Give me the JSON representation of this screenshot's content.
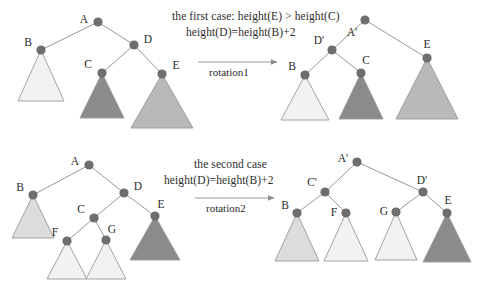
{
  "figure": {
    "title_top": "the first case:  height(E) > height(C)",
    "title_top_line2": "height(D)=height(B)+2",
    "title_bottom": "the second case",
    "title_bottom_line2": "height(D)=height(B)+2",
    "arrow_top_label": "rotation1",
    "arrow_bottom_label": "rotation2",
    "colors": {
      "node_fill": "#6e6e6e",
      "node_stroke": "#5a5a5a",
      "edge": "#8d8d8d",
      "triangle_stroke": "#9a9a9a",
      "tri_lightest": "#f2f2f2",
      "tri_light": "#e8e8e8",
      "tri_mid": "#dcdcdc",
      "tri_medium": "#b9b9b9",
      "tri_dark": "#8b8b8b",
      "text": "#2c2c2c"
    }
  },
  "diagrams": [
    {
      "id": "case1-before",
      "name": "first-case-before-rotation",
      "nodes": [
        {
          "label": "A",
          "x": 98,
          "y": 22,
          "label_x": 84,
          "label_y": 19
        },
        {
          "label": "B",
          "x": 41,
          "y": 50,
          "label_x": 28,
          "label_y": 42
        },
        {
          "label": "D",
          "x": 134,
          "y": 45,
          "label_x": 148,
          "label_y": 39
        },
        {
          "label": "C",
          "x": 102,
          "y": 73,
          "label_x": 88,
          "label_y": 64
        },
        {
          "label": "E",
          "x": 162,
          "y": 74,
          "label_x": 176,
          "label_y": 65
        }
      ],
      "edges": [
        {
          "from": "A",
          "to": "B"
        },
        {
          "from": "A",
          "to": "D"
        },
        {
          "from": "D",
          "to": "C"
        },
        {
          "from": "D",
          "to": "E"
        }
      ],
      "triangles": [
        {
          "label": "B",
          "apex_x": 41,
          "apex_y": 50,
          "half_width": 23,
          "height": 51,
          "fill": "#f2f2f2"
        },
        {
          "label": "C",
          "apex_x": 102,
          "apex_y": 73,
          "half_width": 22,
          "height": 45,
          "fill": "#8b8b8b"
        },
        {
          "label": "E",
          "apex_x": 162,
          "apex_y": 74,
          "half_width": 31,
          "height": 54,
          "fill": "#b9b9b9"
        }
      ]
    },
    {
      "id": "case1-after",
      "name": "first-case-after-rotation",
      "nodes": [
        {
          "label": "A'",
          "x": 365,
          "y": 20,
          "label_x": 352,
          "label_y": 32
        },
        {
          "label": "D'",
          "x": 332,
          "y": 50,
          "label_x": 319,
          "label_y": 40
        },
        {
          "label": "E",
          "x": 427,
          "y": 58,
          "label_x": 427,
          "label_y": 44
        },
        {
          "label": "B",
          "x": 305,
          "y": 75,
          "label_x": 292,
          "label_y": 66
        },
        {
          "label": "C",
          "x": 361,
          "y": 73,
          "label_x": 366,
          "label_y": 60
        }
      ],
      "edges": [
        {
          "from": "A'",
          "to": "D'"
        },
        {
          "from": "A'",
          "to": "E"
        },
        {
          "from": "D'",
          "to": "B"
        },
        {
          "from": "D'",
          "to": "C"
        }
      ],
      "triangles": [
        {
          "label": "B",
          "apex_x": 305,
          "apex_y": 75,
          "half_width": 24,
          "height": 45,
          "fill": "#f2f2f2"
        },
        {
          "label": "C",
          "apex_x": 361,
          "apex_y": 73,
          "half_width": 22,
          "height": 46,
          "fill": "#8b8b8b"
        },
        {
          "label": "E",
          "apex_x": 427,
          "apex_y": 58,
          "half_width": 31,
          "height": 61,
          "fill": "#b9b9b9"
        }
      ]
    },
    {
      "id": "case2-before",
      "name": "second-case-before-rotation",
      "nodes": [
        {
          "label": "A",
          "x": 89,
          "y": 165,
          "label_x": 75,
          "label_y": 161
        },
        {
          "label": "B",
          "x": 33,
          "y": 195,
          "label_x": 20,
          "label_y": 187
        },
        {
          "label": "D",
          "x": 124,
          "y": 193,
          "label_x": 138,
          "label_y": 186
        },
        {
          "label": "C",
          "x": 94,
          "y": 218,
          "label_x": 81,
          "label_y": 209
        },
        {
          "label": "E",
          "x": 155,
          "y": 216,
          "label_x": 161,
          "label_y": 204
        },
        {
          "label": "F",
          "x": 67,
          "y": 241,
          "label_x": 55,
          "label_y": 232
        },
        {
          "label": "G",
          "x": 106,
          "y": 240,
          "label_x": 112,
          "label_y": 229
        }
      ],
      "edges": [
        {
          "from": "A",
          "to": "B"
        },
        {
          "from": "A",
          "to": "D"
        },
        {
          "from": "D",
          "to": "C"
        },
        {
          "from": "D",
          "to": "E"
        },
        {
          "from": "C",
          "to": "F"
        },
        {
          "from": "C",
          "to": "G"
        }
      ],
      "triangles": [
        {
          "label": "B",
          "apex_x": 33,
          "apex_y": 195,
          "half_width": 21,
          "height": 43,
          "fill": "#dcdcdc"
        },
        {
          "label": "E",
          "apex_x": 155,
          "apex_y": 216,
          "half_width": 25,
          "height": 44,
          "fill": "#8b8b8b"
        },
        {
          "label": "F",
          "apex_x": 67,
          "apex_y": 241,
          "half_width": 20,
          "height": 38,
          "fill": "#f2f2f2"
        },
        {
          "label": "G",
          "apex_x": 106,
          "apex_y": 240,
          "half_width": 20,
          "height": 39,
          "fill": "#f2f2f2"
        }
      ]
    },
    {
      "id": "case2-after",
      "name": "second-case-after-rotation",
      "nodes": [
        {
          "label": "A'",
          "x": 357,
          "y": 162,
          "label_x": 343,
          "label_y": 158
        },
        {
          "label": "C'",
          "x": 325,
          "y": 192,
          "label_x": 312,
          "label_y": 182
        },
        {
          "label": "D'",
          "x": 423,
          "y": 192,
          "label_x": 422,
          "label_y": 180
        },
        {
          "label": "B",
          "x": 297,
          "y": 213,
          "label_x": 285,
          "label_y": 205
        },
        {
          "label": "F",
          "x": 346,
          "y": 213,
          "label_x": 334,
          "label_y": 212
        },
        {
          "label": "G",
          "x": 396,
          "y": 212,
          "label_x": 384,
          "label_y": 211
        },
        {
          "label": "E",
          "x": 447,
          "y": 213,
          "label_x": 448,
          "label_y": 200
        }
      ],
      "edges": [
        {
          "from": "A'",
          "to": "C'"
        },
        {
          "from": "A'",
          "to": "D'"
        },
        {
          "from": "C'",
          "to": "B"
        },
        {
          "from": "C'",
          "to": "F"
        },
        {
          "from": "D'",
          "to": "G"
        },
        {
          "from": "D'",
          "to": "E"
        }
      ],
      "triangles": [
        {
          "label": "B",
          "apex_x": 297,
          "apex_y": 213,
          "half_width": 22,
          "height": 48,
          "fill": "#dcdcdc"
        },
        {
          "label": "F",
          "apex_x": 346,
          "apex_y": 213,
          "half_width": 22,
          "height": 48,
          "fill": "#f2f2f2"
        },
        {
          "label": "G",
          "apex_x": 396,
          "apex_y": 212,
          "half_width": 21,
          "height": 48,
          "fill": "#f2f2f2"
        },
        {
          "label": "E",
          "apex_x": 447,
          "apex_y": 213,
          "half_width": 24,
          "height": 49,
          "fill": "#8b8b8b"
        }
      ]
    }
  ],
  "arrows": [
    {
      "name": "rotation1-arrow",
      "x1": 198,
      "y1": 62,
      "x2": 284,
      "y2": 62
    },
    {
      "name": "rotation2-arrow",
      "x1": 195,
      "y1": 198,
      "x2": 281,
      "y2": 198
    }
  ],
  "text_positions": {
    "title_top": {
      "x": 172,
      "y": 10
    },
    "title_top_line2": {
      "x": 186,
      "y": 26
    },
    "arrow_top_label": {
      "x": 209,
      "y": 66
    },
    "title_bottom": {
      "x": 194,
      "y": 158
    },
    "title_bottom_line2": {
      "x": 164,
      "y": 174
    },
    "arrow_bottom_label": {
      "x": 206,
      "y": 202
    }
  }
}
